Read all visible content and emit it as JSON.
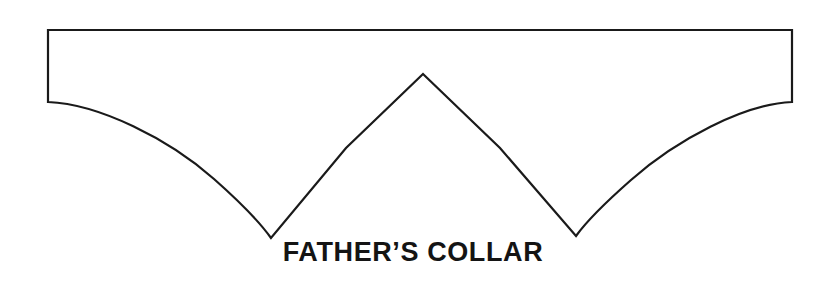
{
  "document": {
    "title": "Father's Collar",
    "background_color": "#ffffff",
    "width": 838,
    "height": 286
  },
  "figure": {
    "name": "fathers-collar-pattern",
    "stroke_color": "#1a1a1a",
    "fill_color": "#ffffff",
    "stroke_width": 2.2,
    "path": "M 48 30 L 792 30 L 792 102 C 744 104 676 140 631 180 C 606 202 586 222 576 236 L 500 148 L 423 74 L 346 148 L 271 238 C 261 224 240 202 214 179 C 169 139 99 104 48 102 Z",
    "points": {
      "rect_top_left": [
        48,
        30
      ],
      "rect_top_right": [
        792,
        30
      ],
      "rect_bottom_right": [
        792,
        102
      ],
      "rect_bottom_left": [
        48,
        102
      ],
      "left_valley": [
        271,
        238
      ],
      "center_peak": [
        423,
        74
      ],
      "right_valley": [
        576,
        236
      ]
    }
  },
  "caption": {
    "label": "FATHER’S COLLAR",
    "color": "#141414",
    "font_size_px": 27,
    "font_weight": "bold"
  }
}
